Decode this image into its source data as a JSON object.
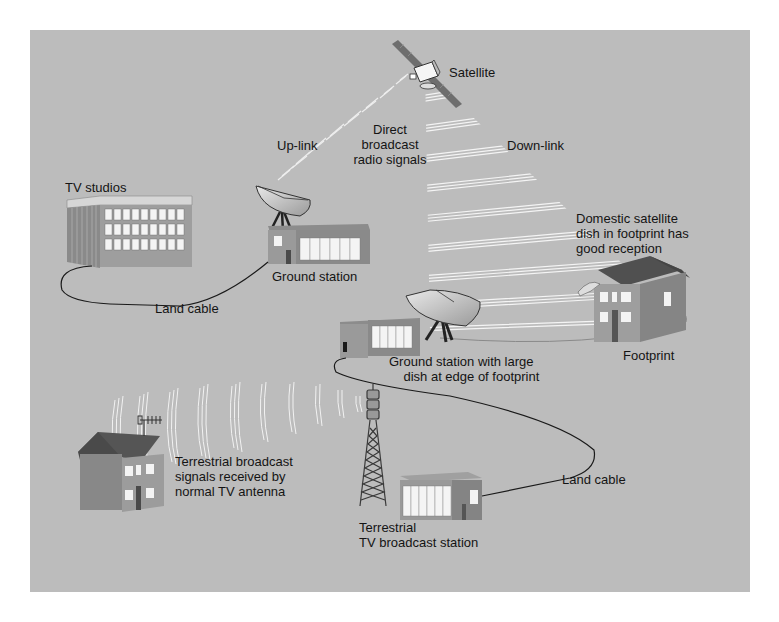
{
  "diagram": {
    "colors": {
      "background": "#bcbcbc",
      "beam": "#f2f2f2",
      "building_front": "#9a9a9a",
      "building_side": "#7e7e7e",
      "roof": "#555555",
      "cable": "#1a1a1a",
      "text": "#141414"
    },
    "labels": {
      "satellite": "Satellite",
      "uplink": "Up-link",
      "direct_broadcast": "Direct\nbroadcast\nradio signals",
      "downlink": "Down-link",
      "tv_studios": "TV studios",
      "ground_station": "Ground station",
      "land_cable_top": "Land cable",
      "domestic_dish": "Domestic satellite\ndish in footprint has\ngood reception",
      "footprint": "Footprint",
      "ground_station_large": "Ground station with large\n    dish at edge of footprint",
      "terrestrial_signals": "Terrestrial broadcast\nsignals received by\nnormal TV antenna",
      "land_cable_bottom": "Land cable",
      "terrestrial_station": "Terrestrial\nTV broadcast station"
    },
    "nodes": [
      {
        "id": "satellite",
        "icon": "satellite-icon"
      },
      {
        "id": "tv-studios",
        "icon": "office-building-icon"
      },
      {
        "id": "ground-station",
        "icon": "satellite-dish-icon"
      },
      {
        "id": "ground-station-large",
        "icon": "satellite-dish-icon"
      },
      {
        "id": "domestic-house",
        "icon": "house-icon"
      },
      {
        "id": "terrestrial-house",
        "icon": "house-icon"
      },
      {
        "id": "broadcast-tower",
        "icon": "transmission-tower-icon"
      },
      {
        "id": "terrestrial-station",
        "icon": "building-icon"
      }
    ],
    "edges": [
      {
        "from": "tv-studios",
        "to": "ground-station",
        "label": "Land cable"
      },
      {
        "from": "ground-station",
        "to": "satellite",
        "label": "Up-link"
      },
      {
        "from": "satellite",
        "to": "footprint",
        "label": "Down-link"
      },
      {
        "from": "ground-station-large",
        "to": "terrestrial-station",
        "label": "Land cable"
      },
      {
        "from": "broadcast-tower",
        "to": "terrestrial-house",
        "label": "Terrestrial broadcast signals"
      }
    ]
  }
}
